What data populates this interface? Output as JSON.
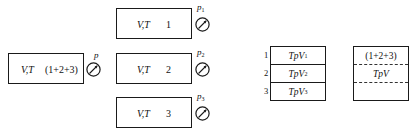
{
  "diagram": {
    "mixture_vessel": {
      "vars_label": "V,T",
      "components_label": "(1+2+3)",
      "gauge_label": "p"
    },
    "component_vessels": [
      {
        "vars_label": "V,T",
        "index": "1",
        "gauge_label": "p",
        "gauge_sub": "1"
      },
      {
        "vars_label": "V,T",
        "index": "2",
        "gauge_label": "p",
        "gauge_sub": "2"
      },
      {
        "vars_label": "V,T",
        "index": "3",
        "gauge_label": "p",
        "gauge_sub": "3"
      }
    ],
    "stacked_partial_volumes": {
      "rows": [
        {
          "num": "1",
          "label": "TpV",
          "sub": "1"
        },
        {
          "num": "2",
          "label": "TpV",
          "sub": "2"
        },
        {
          "num": "3",
          "label": "TpV",
          "sub": "3"
        }
      ]
    },
    "combined_volume": {
      "top_label": "(1+2+3)",
      "mid_label": "TpV",
      "bottom_label": ""
    }
  },
  "colors": {
    "stroke": "#1a1a1a",
    "background": "#ffffff"
  }
}
